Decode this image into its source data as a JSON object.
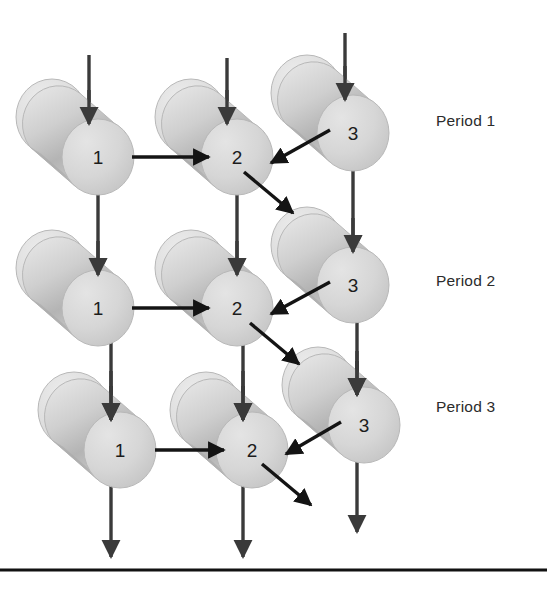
{
  "figure": {
    "background_color": "#ffffff",
    "width": 547,
    "height": 591,
    "bottom_rule": {
      "name": "bottom-rule",
      "color": "#111111",
      "y": 570,
      "x1": 0,
      "x2": 547,
      "thickness": 3
    }
  },
  "style": {
    "cylinder_body_color": "#d0d0d0",
    "cylinder_face_color": "#d6d6d6",
    "cylinder_back_color": "#d9d9d9",
    "cylinder_shade_color": "#a8a8a8",
    "cylinder_outline_color": "#b8b8b8",
    "arrow_color": "#3a3a3a",
    "diagonal_arrow_color": "#141414",
    "label_color": "#1c1c1c"
  },
  "periods": [
    {
      "id": "period-1",
      "label": "Period 1",
      "x": 436,
      "y": 112
    },
    {
      "id": "period-2",
      "label": "Period 2",
      "x": 436,
      "y": 272
    },
    {
      "id": "period-3",
      "label": "Period 3",
      "x": 436,
      "y": 398
    }
  ],
  "nodes": [
    {
      "id": "n-p1-1",
      "label": "1",
      "period": 1,
      "stage": 1,
      "cx": 98,
      "cy": 157,
      "rx": 36,
      "ry": 38
    },
    {
      "id": "n-p1-2",
      "label": "2",
      "period": 1,
      "stage": 2,
      "cx": 237,
      "cy": 157,
      "rx": 36,
      "ry": 38
    },
    {
      "id": "n-p1-3",
      "label": "3",
      "period": 1,
      "stage": 3,
      "cx": 353,
      "cy": 133,
      "rx": 36,
      "ry": 38
    },
    {
      "id": "n-p2-1",
      "label": "1",
      "period": 2,
      "stage": 1,
      "cx": 98,
      "cy": 308,
      "rx": 36,
      "ry": 38
    },
    {
      "id": "n-p2-2",
      "label": "2",
      "period": 2,
      "stage": 2,
      "cx": 237,
      "cy": 308,
      "rx": 36,
      "ry": 38
    },
    {
      "id": "n-p2-3",
      "label": "3",
      "period": 2,
      "stage": 3,
      "cx": 353,
      "cy": 285,
      "rx": 36,
      "ry": 38
    },
    {
      "id": "n-p3-1",
      "label": "1",
      "period": 3,
      "stage": 1,
      "cx": 120,
      "cy": 450,
      "rx": 36,
      "ry": 38
    },
    {
      "id": "n-p3-2",
      "label": "2",
      "period": 3,
      "stage": 2,
      "cx": 252,
      "cy": 450,
      "rx": 36,
      "ry": 38
    },
    {
      "id": "n-p3-3",
      "label": "3",
      "period": 3,
      "stage": 3,
      "cx": 364,
      "cy": 425,
      "rx": 36,
      "ry": 38
    }
  ],
  "arrows": {
    "inflow": [
      {
        "id": "inflow-p1-1",
        "x1": 89,
        "y1": 55,
        "x2": 89,
        "y2": 124
      },
      {
        "id": "inflow-p1-2",
        "x1": 227,
        "y1": 58,
        "x2": 227,
        "y2": 124
      },
      {
        "id": "inflow-p1-3",
        "x1": 345,
        "y1": 33,
        "x2": 345,
        "y2": 100
      },
      {
        "id": "inflow-p3-1",
        "x1": 111,
        "y1": 371,
        "x2": 111,
        "y2": 420
      },
      {
        "id": "inflow-p3-2",
        "x1": 243,
        "y1": 371,
        "x2": 243,
        "y2": 420
      },
      {
        "id": "inflow-p3-3",
        "x1": 357,
        "y1": 351,
        "x2": 357,
        "y2": 395
      }
    ],
    "vertical_transfer": [
      {
        "id": "down-1-p1-p2",
        "x1": 98,
        "y1": 185,
        "x2": 98,
        "y2": 275
      },
      {
        "id": "down-2-p1-p2",
        "x1": 237,
        "y1": 185,
        "x2": 237,
        "y2": 275
      },
      {
        "id": "down-3-p1-p2",
        "x1": 353,
        "y1": 162,
        "x2": 353,
        "y2": 252
      },
      {
        "id": "down-1-p2-p3",
        "x1": 111,
        "y1": 336,
        "x2": 111,
        "y2": 420
      },
      {
        "id": "down-2-p2-p3",
        "x1": 243,
        "y1": 336,
        "x2": 243,
        "y2": 420
      },
      {
        "id": "down-3-p2-p3",
        "x1": 357,
        "y1": 313,
        "x2": 357,
        "y2": 395
      }
    ],
    "horizontal": [
      {
        "id": "flow-1-to-2-p1",
        "x1": 132,
        "y1": 157,
        "x2": 209,
        "y2": 157
      },
      {
        "id": "flow-1-to-2-p2",
        "x1": 132,
        "y1": 308,
        "x2": 209,
        "y2": 308
      },
      {
        "id": "flow-1-to-2-p3",
        "x1": 155,
        "y1": 450,
        "x2": 224,
        "y2": 450
      }
    ],
    "diagonal_in": [
      {
        "id": "flow-3-to-2-p1",
        "x1": 330,
        "y1": 130,
        "x2": 271,
        "y2": 163
      },
      {
        "id": "flow-3-to-2-p2",
        "x1": 330,
        "y1": 282,
        "x2": 271,
        "y2": 314
      },
      {
        "id": "flow-3-to-2-p3",
        "x1": 341,
        "y1": 422,
        "x2": 286,
        "y2": 454
      }
    ],
    "diagonal_out": [
      {
        "id": "outflow-2-p1",
        "x1": 244,
        "y1": 172,
        "x2": 293,
        "y2": 213
      },
      {
        "id": "outflow-2-p2",
        "x1": 250,
        "y1": 323,
        "x2": 299,
        "y2": 364
      },
      {
        "id": "outflow-2-p3",
        "x1": 262,
        "y1": 464,
        "x2": 311,
        "y2": 505
      }
    ],
    "outflow_bottom": [
      {
        "id": "outflow-bottom-1",
        "x1": 111,
        "y1": 485,
        "x2": 111,
        "y2": 557
      },
      {
        "id": "outflow-bottom-2",
        "x1": 243,
        "y1": 485,
        "x2": 243,
        "y2": 557
      },
      {
        "id": "outflow-bottom-3",
        "x1": 357,
        "y1": 462,
        "x2": 357,
        "y2": 532
      }
    ]
  }
}
